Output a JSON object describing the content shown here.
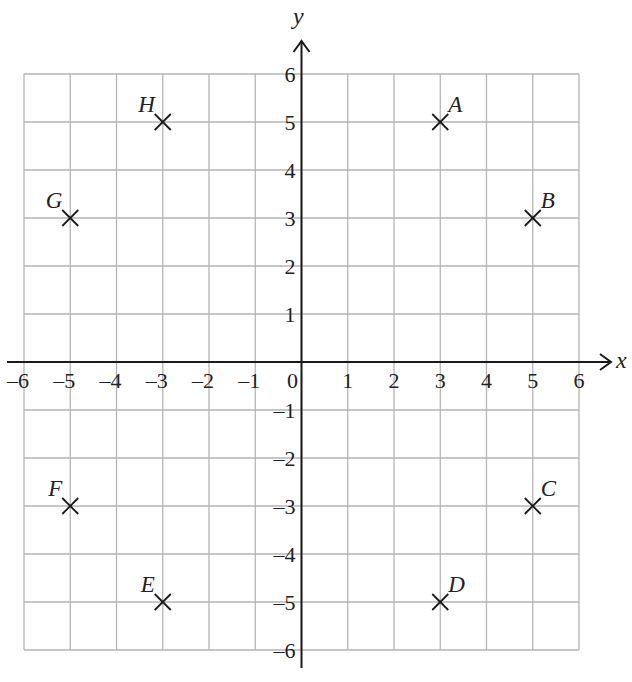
{
  "chart_data": {
    "type": "scatter",
    "title": "",
    "xlabel": "x",
    "ylabel": "y",
    "xlim": [
      -6,
      6
    ],
    "ylim": [
      -6,
      6
    ],
    "grid": true,
    "marker": "cross",
    "x_ticks": [
      "-6",
      "-5",
      "-4",
      "-3",
      "-2",
      "-1",
      "0",
      "1",
      "2",
      "3",
      "4",
      "5",
      "6"
    ],
    "y_ticks": [
      "6",
      "5",
      "4",
      "3",
      "2",
      "1",
      "-1",
      "-2",
      "-3",
      "-4",
      "-5",
      "-6"
    ],
    "points": [
      {
        "label": "A",
        "x": 3,
        "y": 5,
        "label_pos": "ne"
      },
      {
        "label": "B",
        "x": 5,
        "y": 3,
        "label_pos": "ne"
      },
      {
        "label": "C",
        "x": 5,
        "y": -3,
        "label_pos": "ne"
      },
      {
        "label": "D",
        "x": 3,
        "y": -5,
        "label_pos": "ne"
      },
      {
        "label": "E",
        "x": -3,
        "y": -5,
        "label_pos": "nw"
      },
      {
        "label": "F",
        "x": -5,
        "y": -3,
        "label_pos": "nw"
      },
      {
        "label": "G",
        "x": -5,
        "y": 3,
        "label_pos": "nw"
      },
      {
        "label": "H",
        "x": -3,
        "y": 5,
        "label_pos": "nw"
      }
    ]
  },
  "colors": {
    "grid": "#b5b5b5",
    "axis": "#1a1a1a",
    "marker": "#1a1a1a"
  }
}
